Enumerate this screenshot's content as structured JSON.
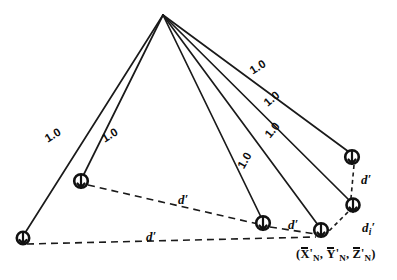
{
  "figure": {
    "type": "geometric-diagram",
    "title": "",
    "background_color": "#ffffff",
    "stroke_color": "#1a1a1a",
    "apex": {
      "name": "apex-vertex",
      "x": 163,
      "y": 15
    },
    "nodes": [
      {
        "id": "node-bottom-left",
        "x": 23,
        "y": 238,
        "marker": "circle-tick"
      },
      {
        "id": "node-left-upper",
        "x": 81,
        "y": 181,
        "marker": "circle-tick"
      },
      {
        "id": "node-center-bottom",
        "x": 263,
        "y": 223,
        "marker": "circle-tick"
      },
      {
        "id": "node-right-far",
        "x": 352,
        "y": 157,
        "marker": "circle-tick"
      },
      {
        "id": "node-right-mid",
        "x": 353,
        "y": 205,
        "marker": "circle-tick"
      },
      {
        "id": "node-coord-point",
        "x": 321,
        "y": 230,
        "marker": "circle-tick"
      }
    ],
    "solid_edges": [
      {
        "from": "apex",
        "to": "node-bottom-left",
        "label": "1.0"
      },
      {
        "from": "apex",
        "to": "node-left-upper",
        "label": "1.0"
      },
      {
        "from": "apex",
        "to": "node-center-bottom",
        "label": "1.0"
      },
      {
        "from": "apex",
        "to": "node-coord-point",
        "label": "1.0"
      },
      {
        "from": "apex",
        "to": "node-right-mid",
        "label": "1.0"
      },
      {
        "from": "apex",
        "to": "node-right-far",
        "label": "1.0"
      }
    ],
    "dashed_edges": [
      {
        "from": "node-left-upper",
        "to": "node-center-bottom",
        "label": "d'"
      },
      {
        "from": "node-center-bottom",
        "to": "node-coord-point",
        "label": "d'"
      },
      {
        "from": "node-bottom-left",
        "to": "node-coord-point",
        "label": "d'"
      },
      {
        "from": "node-right-far",
        "to": "node-right-mid",
        "label": "d'"
      },
      {
        "from": "node-right-mid",
        "to": "node-coord-point",
        "label": "di'"
      }
    ],
    "length_labels": [
      {
        "name": "length-label-left-outer",
        "text": "1.0",
        "x": 43,
        "y": 135,
        "rotate": -31
      },
      {
        "name": "length-label-left-inner",
        "text": "1.0",
        "x": 100,
        "y": 135,
        "rotate": -31
      },
      {
        "name": "length-label-center",
        "text": "1.0",
        "x": 236,
        "y": 165,
        "rotate": -60
      },
      {
        "name": "length-label-right-low",
        "text": "1.0",
        "x": 263,
        "y": 133,
        "rotate": -50
      },
      {
        "name": "length-label-right-mid",
        "text": "1.0",
        "x": 262,
        "y": 100,
        "rotate": -40
      },
      {
        "name": "length-label-right-high",
        "text": "1.0",
        "x": 248,
        "y": 67,
        "rotate": -32
      }
    ],
    "distance_labels": [
      {
        "name": "distance-label-upper-dashed",
        "text": "d",
        "prime": true,
        "sub": "",
        "x": 178,
        "y": 193,
        "rotate": 0
      },
      {
        "name": "distance-label-mid-dashed",
        "text": "d",
        "prime": true,
        "sub": "",
        "x": 288,
        "y": 218,
        "rotate": 0
      },
      {
        "name": "distance-label-lower-dashed",
        "text": "d",
        "prime": true,
        "sub": "",
        "x": 146,
        "y": 230,
        "rotate": 0
      },
      {
        "name": "distance-label-right-upper",
        "text": "d",
        "prime": true,
        "sub": "",
        "x": 361,
        "y": 173,
        "rotate": 0
      },
      {
        "name": "distance-label-right-lower",
        "text": "d",
        "prime": true,
        "sub": "i",
        "x": 362,
        "y": 221,
        "rotate": 0
      }
    ],
    "coordinate_label": {
      "name": "coordinate-point-label",
      "open_paren": "(",
      "close_paren": ")",
      "comma": ",",
      "x_symbol": "X",
      "y_symbol": "Y",
      "z_symbol": "Z",
      "subscript": "N",
      "prime": "'",
      "x": 296,
      "y": 248
    }
  }
}
